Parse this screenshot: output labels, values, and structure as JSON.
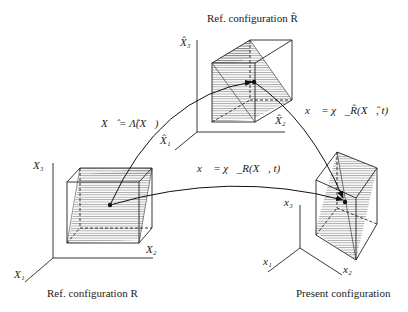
{
  "captions": {
    "ref_hat": "Ref. configuration R̂",
    "ref": "Ref. configuration R",
    "present": "Present configuration"
  },
  "axes": {
    "ref": {
      "x1": "X₁",
      "x2": "X₂",
      "x3": "X₃"
    },
    "ref_hat": {
      "x1": "X̂₁",
      "x2": "X̂₂",
      "x3": "X̂₃"
    },
    "present": {
      "x1": "x₁",
      "x2": "x₂",
      "x3": "x₃"
    }
  },
  "mappings": {
    "lambda": "X⃗̂ = Λ̂(X⃗)",
    "chi_hat": "x⃗ = χ⃗_R̂(X⃗̂, t)",
    "chi": "x⃗ = χ⃗_R(X⃗, t)"
  },
  "colors": {
    "line": "#222222",
    "hatch": "#555555",
    "background": "#ffffff"
  }
}
